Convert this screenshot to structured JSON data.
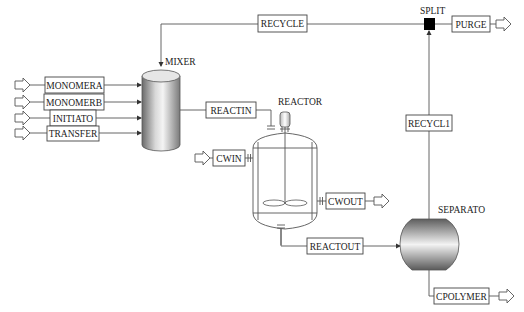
{
  "diagram": {
    "type": "process-flow",
    "blocks": {
      "mixer": {
        "label": "MIXER"
      },
      "reactor": {
        "label": "REACTOR"
      },
      "split": {
        "label": "SPLIT"
      },
      "separator": {
        "label": "SEPARATO"
      }
    },
    "streams": {
      "monomera": "MONOMERA",
      "monomerb": "MONOMERB",
      "initiato": "INITIATO",
      "transfer": "TRANSFER",
      "recycle": "RECYCLE",
      "purge": "PURGE",
      "reactin": "REACTIN",
      "cwin": "CWIN",
      "cwout": "CWOUT",
      "reactout": "REACTOUT",
      "recycl1": "RECYCL1",
      "cpolymer": "CPOLYMER"
    },
    "colors": {
      "line": "#555555",
      "split_block": "#000000",
      "vessel_shade_dark": "#6f6f6f",
      "vessel_shade_light": "#f2f2f2"
    }
  }
}
